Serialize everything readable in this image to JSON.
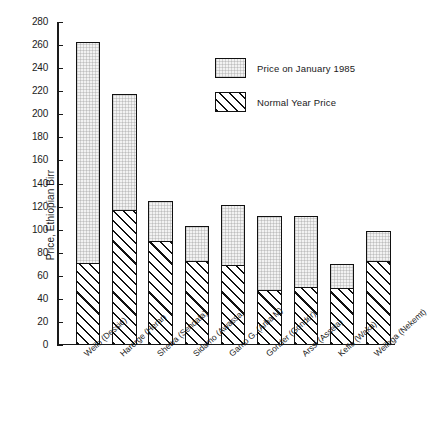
{
  "chart_data": {
    "type": "bar",
    "subtype": "stacked",
    "title": "",
    "xlabel": "",
    "ylabel": "Price, Ethiopian Birr",
    "ylim": [
      0,
      280
    ],
    "ytick_step": 20,
    "yticks": [
      0,
      20,
      40,
      60,
      80,
      100,
      120,
      140,
      160,
      180,
      200,
      220,
      240,
      260,
      280
    ],
    "grid": false,
    "legend_position": "upper-right-inside",
    "categories": [
      "Wello (Dessie)",
      "Harerge (Herar)",
      "Shewa (Sendafa)",
      "Sidamo (Awassa)",
      "Gamo G. (Arba M)",
      "Gonder (Gonder)",
      "Arssi (Assela)",
      "Keffa (Waka)",
      "Wellega (Nekemt)"
    ],
    "series": [
      {
        "name": "Normal Year Price",
        "pattern": "diagonal-hatch",
        "values": [
          71,
          117,
          90,
          73,
          69,
          48,
          50,
          49,
          73
        ]
      },
      {
        "name": "Price on January 1985",
        "pattern": "light-stipple",
        "note": "values are the stacked bar totals (top of bar)",
        "values": [
          263,
          218,
          125,
          103,
          121,
          112,
          112,
          70,
          99
        ]
      }
    ]
  },
  "legend": {
    "items": [
      {
        "label": "Price on January 1985",
        "swatch": "stipple-swatch"
      },
      {
        "label": "Normal Year Price",
        "swatch": "hatch-swatch"
      }
    ]
  },
  "axis": {
    "y_title": "Price, Ethiopian Birr"
  }
}
